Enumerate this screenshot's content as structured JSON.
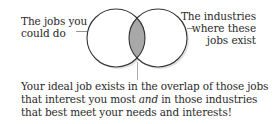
{
  "diagram": {
    "type": "venn",
    "left_set": {
      "label_lines": [
        "The jobs you",
        "could do"
      ]
    },
    "right_set": {
      "label_lines": [
        "The industries",
        "where these",
        "jobs exist"
      ]
    },
    "overlap": {
      "fill_color": "#a8a8a8"
    },
    "circle_stroke_color": "#333333",
    "caption": {
      "line1": "Your ideal job exists in the overlap of those jobs",
      "line2_before": "that interest you most ",
      "line2_emphasis": "and",
      "line2_after": " in those industries",
      "line3": "that best meet your needs and interests!"
    }
  }
}
